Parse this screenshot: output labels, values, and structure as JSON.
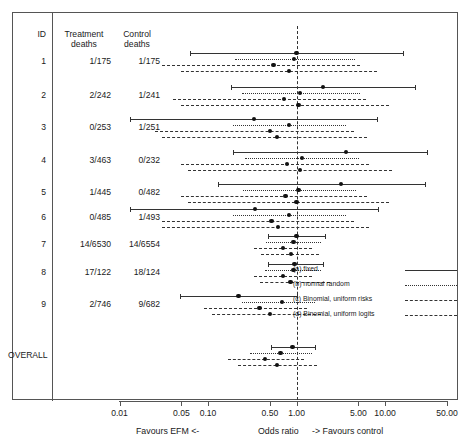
{
  "figure": {
    "columns": {
      "id": "ID",
      "treatment_line1": "Treatment",
      "treatment_line2": "deaths",
      "control_line1": "Control",
      "control_line2": "deaths"
    },
    "overall_label": "OVERALL",
    "axis": {
      "ticks": [
        "0.01",
        "0.05",
        "0.10",
        "0.50",
        "1.00",
        "5.00",
        "10.00",
        "50.00"
      ],
      "title": "Odds ratio",
      "left_note": "Favours EFM  <-",
      "right_note": "->  Favours control"
    },
    "legend": {
      "items": [
        {
          "label": "(a) fixed",
          "style": "solid"
        },
        {
          "label": "(b) normal random",
          "style": "dotted"
        },
        {
          "label": "(c) Binomial, uniform risks",
          "style": "dashed-short"
        },
        {
          "label": "(d) Binomial, uniform logits",
          "style": "dashed-long"
        }
      ]
    }
  },
  "chart_data": {
    "type": "forest",
    "title": "",
    "xlabel": "Odds ratio",
    "ylabel": "",
    "xscale": "log",
    "xlim": [
      0.01,
      50.0
    ],
    "null_value": 1.0,
    "grid": false,
    "legend_position": "right-middle",
    "series_names": [
      "(a) fixed",
      "(b) normal random",
      "(c) Binomial, uniform risks",
      "(d) Binomial, uniform logits"
    ],
    "rows": [
      {
        "id": "1",
        "treatment_deaths": "1/175",
        "control_deaths": "1/175",
        "estimates": [
          {
            "series": "(a) fixed",
            "or": 1.0,
            "lo": 0.062,
            "hi": 16.1
          },
          {
            "series": "(b) normal random",
            "or": 0.93,
            "lo": 0.2,
            "hi": 4.6
          },
          {
            "series": "(c) Binomial, uniform risks",
            "or": 0.55,
            "lo": 0.03,
            "hi": 5.2
          },
          {
            "series": "(d) Binomial, uniform logits",
            "or": 0.82,
            "lo": 0.05,
            "hi": 8.0
          }
        ]
      },
      {
        "id": "2",
        "treatment_deaths": "2/242",
        "control_deaths": "1/241",
        "estimates": [
          {
            "series": "(a) fixed",
            "or": 1.99,
            "lo": 0.18,
            "hi": 22.0
          },
          {
            "series": "(b) normal random",
            "or": 1.1,
            "lo": 0.24,
            "hi": 5.2
          },
          {
            "series": "(c) Binomial, uniform risks",
            "or": 0.72,
            "lo": 0.04,
            "hi": 6.1
          },
          {
            "series": "(d) Binomial, uniform logits",
            "or": 1.05,
            "lo": 0.05,
            "hi": 11.0
          }
        ]
      },
      {
        "id": "3",
        "treatment_deaths": "0/253",
        "control_deaths": "1/251",
        "estimates": [
          {
            "series": "(a) fixed",
            "or": 0.33,
            "lo": 0.013,
            "hi": 8.2
          },
          {
            "series": "(b) normal random",
            "or": 0.82,
            "lo": 0.19,
            "hi": 3.6
          },
          {
            "series": "(c) Binomial, uniform risks",
            "or": 0.5,
            "lo": 0.025,
            "hi": 4.4
          },
          {
            "series": "(d) Binomial, uniform logits",
            "or": 0.6,
            "lo": 0.03,
            "hi": 6.2
          }
        ]
      },
      {
        "id": "4",
        "treatment_deaths": "3/463",
        "control_deaths": "0/232",
        "estimates": [
          {
            "series": "(a) fixed",
            "or": 3.6,
            "lo": 0.19,
            "hi": 30.0
          },
          {
            "series": "(b) normal random",
            "or": 1.15,
            "lo": 0.26,
            "hi": 5.1
          },
          {
            "series": "(c) Binomial, uniform risks",
            "or": 0.78,
            "lo": 0.05,
            "hi": 6.5
          },
          {
            "series": "(d) Binomial, uniform logits",
            "or": 1.1,
            "lo": 0.06,
            "hi": 12.0
          }
        ]
      },
      {
        "id": "5",
        "treatment_deaths": "1/445",
        "control_deaths": "0/482",
        "estimates": [
          {
            "series": "(a) fixed",
            "or": 3.2,
            "lo": 0.13,
            "hi": 28.0
          },
          {
            "series": "(b) normal random",
            "or": 1.05,
            "lo": 0.25,
            "hi": 4.7
          },
          {
            "series": "(c) Binomial, uniform risks",
            "or": 0.75,
            "lo": 0.05,
            "hi": 6.2
          },
          {
            "series": "(d) Binomial, uniform logits",
            "or": 1.0,
            "lo": 0.06,
            "hi": 11.0
          }
        ]
      },
      {
        "id": "6",
        "treatment_deaths": "0/485",
        "control_deaths": "1/493",
        "estimates": [
          {
            "series": "(a) fixed",
            "or": 0.34,
            "lo": 0.013,
            "hi": 8.4
          },
          {
            "series": "(b) normal random",
            "or": 0.82,
            "lo": 0.19,
            "hi": 3.6
          },
          {
            "series": "(c) Binomial, uniform risks",
            "or": 0.52,
            "lo": 0.03,
            "hi": 4.5
          },
          {
            "series": "(d) Binomial, uniform logits",
            "or": 0.62,
            "lo": 0.03,
            "hi": 6.5
          }
        ]
      },
      {
        "id": "7",
        "treatment_deaths": "14/6530",
        "control_deaths": "14/6554",
        "estimates": [
          {
            "series": "(a) fixed",
            "or": 1.0,
            "lo": 0.48,
            "hi": 2.1
          },
          {
            "series": "(b) normal random",
            "or": 0.92,
            "lo": 0.45,
            "hi": 1.9
          },
          {
            "series": "(c) Binomial, uniform risks",
            "or": 0.7,
            "lo": 0.33,
            "hi": 1.5
          },
          {
            "series": "(d) Binomial, uniform logits",
            "or": 0.86,
            "lo": 0.4,
            "hi": 1.8
          }
        ]
      },
      {
        "id": "8",
        "treatment_deaths": "17/122",
        "control_deaths": "18/124",
        "estimates": [
          {
            "series": "(a) fixed",
            "or": 0.95,
            "lo": 0.47,
            "hi": 2.0
          },
          {
            "series": "(b) normal random",
            "or": 0.92,
            "lo": 0.44,
            "hi": 1.9
          },
          {
            "series": "(c) Binomial, uniform risks",
            "or": 0.7,
            "lo": 0.33,
            "hi": 1.5
          },
          {
            "series": "(d) Binomial, uniform logits",
            "or": 0.85,
            "lo": 0.39,
            "hi": 2.4
          }
        ]
      },
      {
        "id": "9",
        "treatment_deaths": "2/746",
        "control_deaths": "9/682",
        "estimates": [
          {
            "series": "(a) fixed",
            "or": 0.22,
            "lo": 0.048,
            "hi": 1.0
          },
          {
            "series": "(b) normal random",
            "or": 0.68,
            "lo": 0.24,
            "hi": 1.6
          },
          {
            "series": "(c) Binomial, uniform risks",
            "or": 0.38,
            "lo": 0.09,
            "hi": 1.3
          },
          {
            "series": "(d) Binomial, uniform logits",
            "or": 0.5,
            "lo": 0.11,
            "hi": 1.9
          }
        ]
      },
      {
        "id": "OVERALL",
        "treatment_deaths": "",
        "control_deaths": "",
        "estimates": [
          {
            "series": "(a) fixed",
            "or": 0.9,
            "lo": 0.52,
            "hi": 1.6
          },
          {
            "series": "(b) normal random",
            "or": 0.66,
            "lo": 0.3,
            "hi": 1.5
          },
          {
            "series": "(c) Binomial, uniform risks",
            "or": 0.44,
            "lo": 0.17,
            "hi": 1.2
          },
          {
            "series": "(d) Binomial, uniform logits",
            "or": 0.6,
            "lo": 0.22,
            "hi": 1.7
          }
        ]
      }
    ]
  }
}
